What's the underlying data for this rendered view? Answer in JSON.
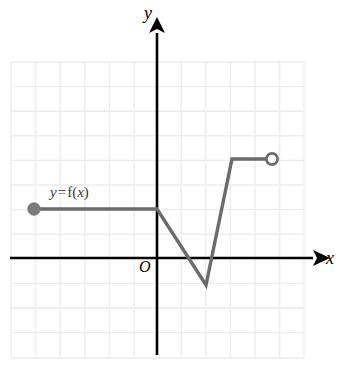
{
  "figure": {
    "background_color": "#ffffff"
  },
  "labels": {
    "y_axis": "y",
    "x_axis": "x",
    "origin": "O",
    "function_y": "y",
    "function_equals": "=",
    "function_f": "f",
    "function_open_paren": "(",
    "function_var": "x",
    "function_close_paren": ")",
    "function_full": "y = f(x)"
  },
  "colors": {
    "axis": "#000000",
    "curve": "#6b6b6b",
    "grid_major": "#e4e4e4",
    "grid_minor": "#f0eeee",
    "grid_border": "#e0e0e0",
    "filled_point": "#7a7a7a",
    "open_point_stroke": "#6b6b6b",
    "open_point_fill": "#ffffff",
    "text": "#000000"
  },
  "chart_data": {
    "type": "line",
    "xlabel": "x",
    "ylabel": "y",
    "xlim": [
      -6,
      6
    ],
    "ylim": [
      -8,
      4
    ],
    "grid": true,
    "grid_step": 1,
    "legend": "none",
    "series": [
      {
        "name": "f(x)",
        "points": [
          {
            "x": -5,
            "y": 2
          },
          {
            "x": 0,
            "y": 2
          },
          {
            "x": 2,
            "y": -1
          },
          {
            "x": 3,
            "y": 4
          },
          {
            "x": 4.7,
            "y": 4
          }
        ]
      }
    ],
    "endpoints": [
      {
        "x": -5,
        "y": 2,
        "style": "filled",
        "meaning": "closed-endpoint-included"
      },
      {
        "x": 4.7,
        "y": 4,
        "style": "open",
        "meaning": "open-endpoint-excluded"
      }
    ],
    "annotations": [
      {
        "text": "y = f(x)",
        "x": -4.3,
        "y": 3.0
      },
      {
        "text": "O",
        "x": -0.7,
        "y": -0.45
      }
    ]
  },
  "geometry": {
    "origin_px": {
      "x": 157,
      "y": 258
    },
    "cell_px": 24.6,
    "grid_rect_px": {
      "left": 11,
      "top": 62,
      "right": 304,
      "bottom": 358
    },
    "curve_path_px": [
      {
        "x": 34,
        "y": 209
      },
      {
        "x": 157,
        "y": 209
      },
      {
        "x": 206,
        "y": 285
      },
      {
        "x": 232,
        "y": 159
      },
      {
        "x": 272,
        "y": 159
      }
    ],
    "filled_dot_px": {
      "x": 34,
      "y": 209,
      "r": 6
    },
    "open_dot_px": {
      "x": 272,
      "y": 159,
      "r": 6
    },
    "x_axis_px": {
      "x1": 10,
      "y1": 258,
      "x2": 318,
      "y2": 258
    },
    "y_axis_px": {
      "x1": 157,
      "y1": 25,
      "x2": 157,
      "y2": 355
    },
    "curve_width_px": 3.4,
    "axis_width_px": 2.6
  }
}
